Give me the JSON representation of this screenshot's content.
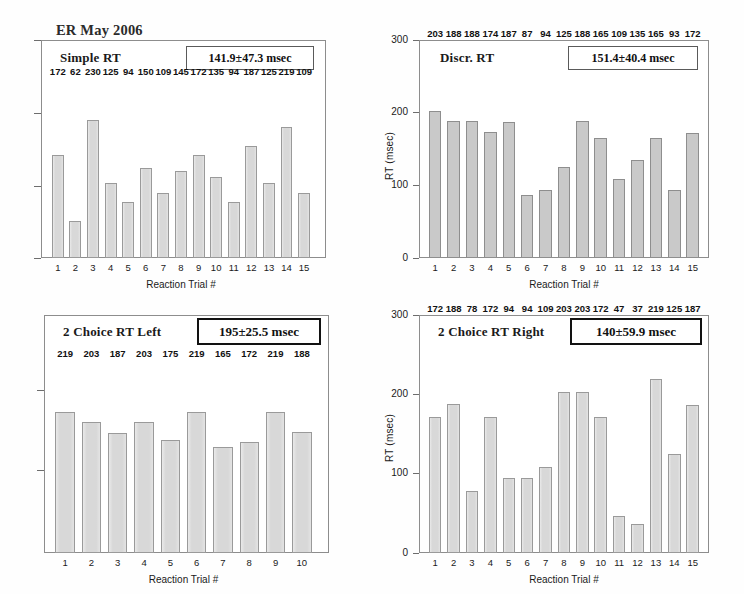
{
  "header": {
    "title": "ER May 2006"
  },
  "common": {
    "xlabel": "Reaction Trial #",
    "ylabel": "RT (msec)",
    "bar_color": "#d8d8d8",
    "bar_border_color": "#9a9a9a",
    "frame_color": "#8d8d8d"
  },
  "chart_data": [
    {
      "id": "simple-rt",
      "type": "bar",
      "title": "Simple RT",
      "stat": "141.9±47.3 msec",
      "xlabel": "Reaction Trial #",
      "ylabel": "",
      "ylim": [
        0,
        300
      ],
      "yticks": [],
      "ytick_labels": [],
      "grid": false,
      "legend": "none",
      "categories": [
        "1",
        "2",
        "3",
        "4",
        "5",
        "6",
        "7",
        "8",
        "9",
        "10",
        "11",
        "12",
        "13",
        "14",
        "15"
      ],
      "values": [
        172,
        62,
        230,
        125,
        94,
        150,
        109,
        145,
        172,
        135,
        94,
        187,
        125,
        219,
        109
      ]
    },
    {
      "id": "discr-rt",
      "type": "bar",
      "title": "Discr. RT",
      "stat": "151.4±40.4 msec",
      "xlabel": "Reaction Trial #",
      "ylabel": "RT (msec)",
      "ylim": [
        0,
        300
      ],
      "yticks": [
        0,
        100,
        200,
        300
      ],
      "ytick_labels": [
        "0",
        "100",
        "200",
        "300"
      ],
      "grid": false,
      "legend": "none",
      "categories": [
        "1",
        "2",
        "3",
        "4",
        "5",
        "6",
        "7",
        "8",
        "9",
        "10",
        "11",
        "12",
        "13",
        "14",
        "15"
      ],
      "values": [
        203,
        188,
        188,
        174,
        187,
        87,
        94,
        125,
        188,
        165,
        109,
        135,
        165,
        93,
        172
      ]
    },
    {
      "id": "two-choice-rt-left",
      "type": "bar",
      "title": "2 Choice RT Left",
      "stat": "195±25.5 msec",
      "xlabel": "Reaction Trial #",
      "ylabel": "",
      "ylim": [
        0,
        300
      ],
      "yticks": [],
      "ytick_labels": [],
      "grid": false,
      "legend": "none",
      "categories": [
        "1",
        "2",
        "3",
        "4",
        "5",
        "6",
        "7",
        "8",
        "9",
        "10"
      ],
      "values": [
        219,
        203,
        187,
        203,
        175,
        219,
        165,
        172,
        219,
        188
      ]
    },
    {
      "id": "two-choice-rt-right",
      "type": "bar",
      "title": "2 Choice RT Right",
      "stat": "140±59.9  msec",
      "xlabel": "Reaction Trial #",
      "ylabel": "RT (msec)",
      "ylim": [
        0,
        300
      ],
      "yticks": [
        0,
        100,
        200,
        300
      ],
      "ytick_labels": [
        "0",
        "100",
        "200",
        "300"
      ],
      "grid": false,
      "legend": "none",
      "categories": [
        "1",
        "2",
        "3",
        "4",
        "5",
        "6",
        "7",
        "8",
        "9",
        "10",
        "11",
        "12",
        "13",
        "14",
        "15"
      ],
      "values": [
        172,
        188,
        78,
        172,
        94,
        94,
        109,
        203,
        203,
        172,
        47,
        37,
        219,
        125,
        187
      ]
    }
  ]
}
